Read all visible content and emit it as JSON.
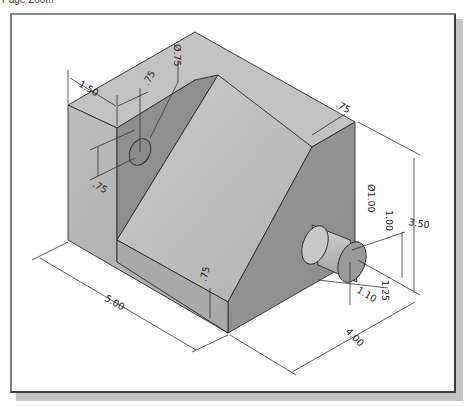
{
  "header": {
    "label": "Page Zoom"
  },
  "drawing": {
    "title": "Isometric view of angled support block with hole and boss",
    "dimensions": {
      "hole_diameter": "Ø.75",
      "hole_offset_x": "1.50",
      "hole_offset_depth": ".75",
      "hole_offset_height": ".75",
      "wall_thickness_top": ".75",
      "base_thickness": ".75",
      "boss_diameter": "Ø1.00",
      "boss_height_from_base": "1.00",
      "overall_height": "3.50",
      "boss_length": "1.10",
      "boss_offset": "1.25",
      "overall_length": "5.00",
      "overall_depth": "4.00"
    }
  },
  "colors": {
    "face_light": "#b9b9b9",
    "face_mid": "#a8a8a8",
    "face_dark": "#8e8e8e",
    "edge": "#2a2a2a",
    "frame_border": "#3c3c3c",
    "shadow": "#c4c4c4"
  }
}
